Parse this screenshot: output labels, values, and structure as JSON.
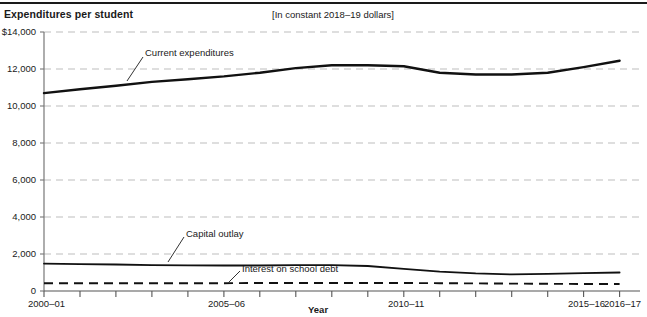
{
  "header": {
    "title": "Expenditures per student",
    "subtitle": "[In constant 2018–19 dollars]"
  },
  "axis": {
    "x_title": "Year",
    "y_tick_labels": [
      "$14,000",
      "12,000",
      "10,000",
      "8,000",
      "6,000",
      "4,000",
      "2,000",
      "0"
    ],
    "x_tick_labels": [
      "2000–01",
      "2005–06",
      "2010–11",
      "2015–16",
      "2016–17"
    ]
  },
  "series_labels": {
    "current": "Current expenditures",
    "capital": "Capital outlay",
    "interest": "Interest on school debt"
  },
  "colors": {
    "line": "#111111",
    "grid": "#bdbdbd",
    "axis": "#555555",
    "text": "#1a1a1a"
  },
  "chart_data": {
    "type": "line",
    "title": "Expenditures per student",
    "subtitle": "[In constant 2018–19 dollars]",
    "xlabel": "Year",
    "ylabel": "Expenditures per student",
    "ylim": [
      0,
      14000
    ],
    "ytick_values": [
      0,
      2000,
      4000,
      6000,
      8000,
      10000,
      12000,
      14000
    ],
    "grid": "horizontal-dashed",
    "legend": "inline-annotations",
    "x": [
      "2000-01",
      "2001-02",
      "2002-03",
      "2003-04",
      "2004-05",
      "2005-06",
      "2006-07",
      "2007-08",
      "2008-09",
      "2009-10",
      "2010-11",
      "2011-12",
      "2012-13",
      "2013-14",
      "2014-15",
      "2015-16",
      "2016-17"
    ],
    "xtick_labeled": [
      "2000-01",
      "2005-06",
      "2010-11",
      "2015-16",
      "2016-17"
    ],
    "series": [
      {
        "name": "Current expenditures",
        "style": "solid",
        "values": [
          10700,
          10900,
          11100,
          11300,
          11450,
          11600,
          11800,
          12050,
          12200,
          12200,
          12150,
          11800,
          11700,
          11700,
          11800,
          12100,
          12450
        ]
      },
      {
        "name": "Capital outlay",
        "style": "solid",
        "values": [
          1480,
          1450,
          1430,
          1400,
          1390,
          1380,
          1380,
          1400,
          1400,
          1350,
          1200,
          1050,
          950,
          900,
          930,
          970,
          1000
        ]
      },
      {
        "name": "Interest on school debt",
        "style": "dashed",
        "values": [
          420,
          420,
          420,
          420,
          420,
          420,
          430,
          430,
          430,
          430,
          430,
          420,
          410,
          400,
          390,
          380,
          380
        ]
      }
    ]
  }
}
